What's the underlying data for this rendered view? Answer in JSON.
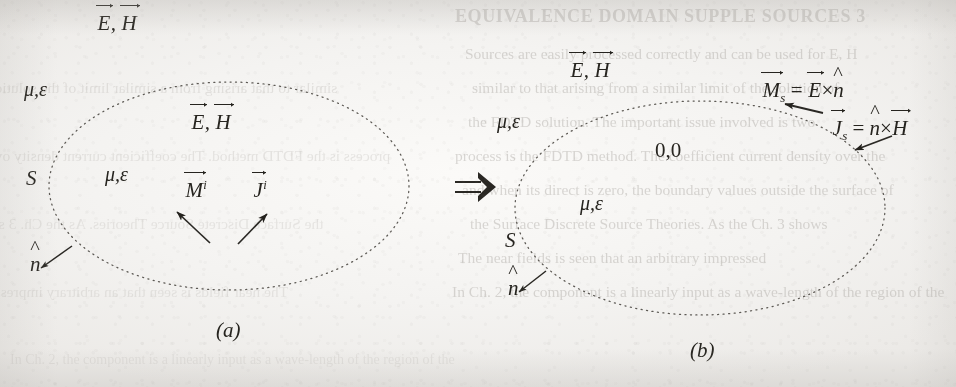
{
  "figure": {
    "kind": "surface-equivalence-principle",
    "transform_symbol": "⇒",
    "ink_color": "#26241f",
    "paper_color": "#f4f3f1",
    "boundary_style": "dotted"
  },
  "panel_a": {
    "caption": "(a)",
    "exterior_fields_label": {
      "E": "E",
      "comma": ",",
      "H": "H"
    },
    "exterior_medium_label": {
      "mu": "μ",
      "comma": ",",
      "eps": "ε"
    },
    "interior_fields_label": {
      "E": "E",
      "comma": ",",
      "H": "H"
    },
    "interior_medium_label": {
      "mu": "μ",
      "comma": ",",
      "eps": "ε"
    },
    "surface_label": "S",
    "normal_label": "n",
    "source_magnetic": {
      "symbol": "M",
      "superscript": "i"
    },
    "source_electric": {
      "symbol": "J",
      "superscript": "i"
    }
  },
  "panel_b": {
    "caption": "(b)",
    "exterior_fields_label": {
      "E": "E",
      "comma": ",",
      "H": "H"
    },
    "exterior_medium_label": {
      "mu": "μ",
      "comma": ",",
      "eps": "ε"
    },
    "interior_fields_label": "0,0",
    "interior_medium_label": {
      "mu": "μ",
      "comma": ",",
      "eps": "ε"
    },
    "surface_label": "S",
    "normal_label": "n",
    "equation_magnetic": {
      "lhs_symbol": "M",
      "lhs_subscript": "s",
      "equals": "=",
      "rhs_first": "E",
      "cross": "×",
      "rhs_second": "n"
    },
    "equation_electric": {
      "lhs_symbol": "J",
      "lhs_subscript": "s",
      "equals": "=",
      "rhs_first": "n",
      "cross": "×",
      "rhs_second": "H"
    }
  },
  "background_bleed": {
    "heading": "EQUIVALENCE DOMAIN SUPPLE  SOURCES  3",
    "lines": [
      "Sources  are easily  processed  correctly  and  can  be  used  for  E, H",
      "similar  to  that  arising  from  a  similar  limit  of  the  solution  of",
      "the  FDTD  solution.  The  important  issue  involved  is  two",
      "process  is  the  FDTD  method.  The  coefficient  current  density  over  the",
      "and  when  its  direct  is  zero,  the  boundary  values  outside  the  surface  of",
      "the  Surface  Discrete  Source  Theories.  As  the  Ch.  3  shows",
      "The  near  fields  is  seen  that  an  arbitrary  impressed",
      "In  Ch.  2,  the  component  is  a  linearly  input  as  a  wave-length  of  the  region  of  the"
    ]
  }
}
